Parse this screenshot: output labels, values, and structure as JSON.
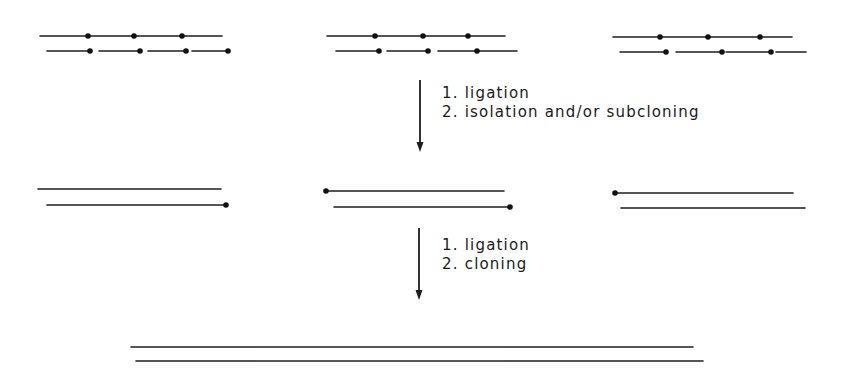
{
  "diagram": {
    "title": "",
    "colors": {
      "ink": "#1e1e1e",
      "background": "#ffffff"
    },
    "stages": [
      {
        "name": "fragments",
        "groups": [
          {
            "top": {
              "y": 36,
              "segments": [
                [
                  40,
                  86
                ],
                [
                  88,
                  132
                ],
                [
                  134,
                  180
                ],
                [
                  182,
                  222
                ]
              ],
              "dots": [
                88,
                134,
                182
              ]
            },
            "bottom": {
              "y": 51,
              "segments": [
                [
                  47,
                  90
                ],
                [
                  99,
                  140
                ],
                [
                  148,
                  186
                ],
                [
                  192,
                  228
                ]
              ],
              "dots": [
                90,
                140,
                186,
                228
              ]
            }
          },
          {
            "top": {
              "y": 36,
              "segments": [
                [
                  327,
                  372
                ],
                [
                  375,
                  420
                ],
                [
                  423,
                  466
                ],
                [
                  468,
                  505
                ]
              ],
              "dots": [
                375,
                423,
                468
              ]
            },
            "bottom": {
              "y": 51,
              "segments": [
                [
                  336,
                  379
                ],
                [
                  387,
                  428
                ],
                [
                  438,
                  477
                ],
                [
                  479,
                  517
                ]
              ],
              "dots": [
                379,
                428,
                477
              ]
            }
          },
          {
            "top": {
              "y": 37,
              "segments": [
                [
                  613,
                  657
                ],
                [
                  660,
                  708
                ],
                [
                  710,
                  757
                ],
                [
                  760,
                  792
                ]
              ],
              "dots": [
                660,
                708,
                760
              ]
            },
            "bottom": {
              "y": 52,
              "segments": [
                [
                  620,
                  666
                ],
                [
                  676,
                  722
                ],
                [
                  726,
                  771
                ],
                [
                  776,
                  806
                ]
              ],
              "dots": [
                666,
                722,
                771
              ]
            }
          }
        ]
      },
      {
        "name": "intermediate-duplexes",
        "groups": [
          {
            "top": {
              "x1": 38,
              "x2": 221,
              "y": 189,
              "dots": []
            },
            "bottom": {
              "x1": 47,
              "x2": 226,
              "y": 205,
              "dots": [
                226
              ]
            }
          },
          {
            "top": {
              "x1": 326,
              "x2": 504,
              "y": 191,
              "dots": [
                326
              ]
            },
            "bottom": {
              "x1": 334,
              "x2": 510,
              "y": 207,
              "dots": [
                510
              ]
            }
          },
          {
            "top": {
              "x1": 615,
              "x2": 793,
              "y": 193,
              "dots": [
                615
              ]
            },
            "bottom": {
              "x1": 621,
              "x2": 805,
              "y": 208,
              "dots": []
            }
          }
        ]
      },
      {
        "name": "final-duplex",
        "top": {
          "x1": 131,
          "x2": 693,
          "y": 347
        },
        "bottom": {
          "x1": 136,
          "x2": 703,
          "y": 361
        }
      }
    ],
    "arrows": [
      {
        "x": 420,
        "y1": 80,
        "y2": 152
      },
      {
        "x": 419,
        "y1": 228,
        "y2": 300
      }
    ],
    "steps": [
      {
        "lines": [
          "1. ligation",
          "2. isolation and/or subcloning"
        ],
        "x": 442,
        "y": [
          98,
          117
        ]
      },
      {
        "lines": [
          "1. ligation",
          "2. cloning"
        ],
        "x": 442,
        "y": [
          250,
          269
        ]
      }
    ]
  }
}
